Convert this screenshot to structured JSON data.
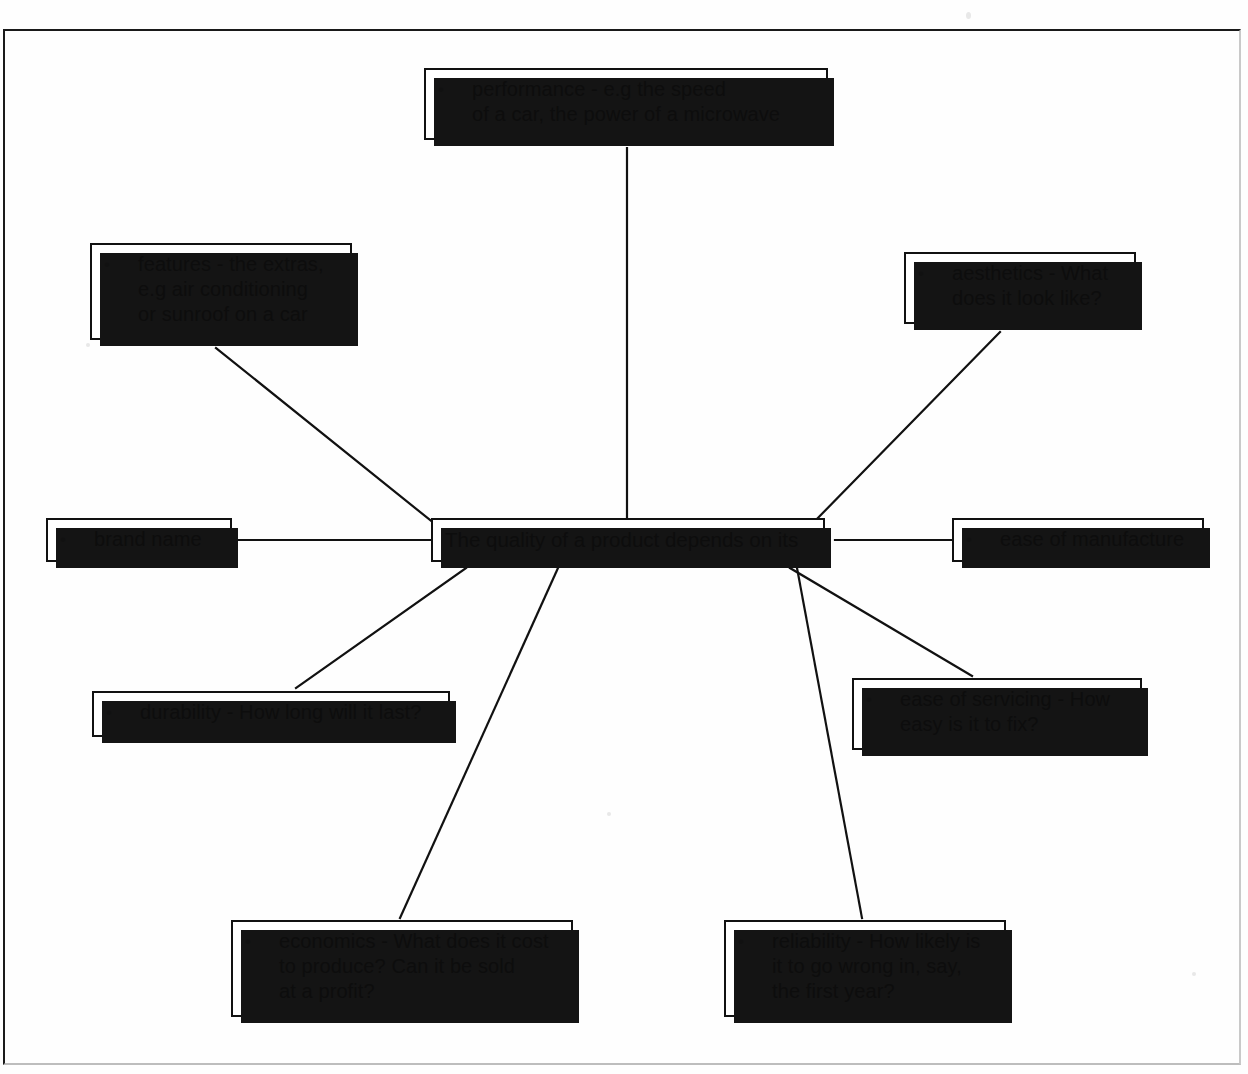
{
  "diagram": {
    "type": "mind-map",
    "title_node": "The quality of a product depends on its",
    "bullet_glyph": "•",
    "colors": {
      "ink": "#111111",
      "paper": "#ffffff",
      "shadow": "#141414",
      "frame": "#1a1a1a"
    },
    "center": {
      "label": "The quality of a product depends on its",
      "x": 431,
      "y": 518,
      "w": 394,
      "h": 44
    },
    "nodes": [
      {
        "id": "performance",
        "label": "performance - e.g the speed\nof a car, the power of a microwave",
        "bullet": "•",
        "x": 424,
        "y": 68,
        "w": 404,
        "h": 72
      },
      {
        "id": "features",
        "label": "features - the extras,\ne.g air conditioning\nor sunroof on a car",
        "bullet": "•",
        "x": 90,
        "y": 243,
        "w": 262,
        "h": 97
      },
      {
        "id": "aesthetics",
        "label": "aesthetics - What\ndoes it look like?",
        "bullet": "•",
        "x": 904,
        "y": 252,
        "w": 232,
        "h": 72
      },
      {
        "id": "brand-name",
        "label": "brand name",
        "bullet": "•",
        "x": 46,
        "y": 518,
        "w": 186,
        "h": 44
      },
      {
        "id": "ease-of-manufacture",
        "label": "ease of manufacture",
        "bullet": "•",
        "x": 952,
        "y": 518,
        "w": 252,
        "h": 44
      },
      {
        "id": "durability",
        "label": "durability - How long will it last?",
        "bullet": "•",
        "x": 92,
        "y": 691,
        "w": 358,
        "h": 46
      },
      {
        "id": "ease-of-servicing",
        "label": "ease of servicing - How\neasy is it to fix?",
        "bullet": "•",
        "x": 852,
        "y": 678,
        "w": 290,
        "h": 72
      },
      {
        "id": "economics",
        "label": "economics - What does it cost\nto produce? Can it be sold\nat a profit?",
        "bullet": "•",
        "x": 231,
        "y": 920,
        "w": 342,
        "h": 97
      },
      {
        "id": "reliability",
        "label": "reliability - How likely is\nit to go wrong in, say,\nthe first year?",
        "bullet": "•",
        "x": 724,
        "y": 920,
        "w": 282,
        "h": 97
      }
    ],
    "connectors": [
      {
        "from": "center",
        "to": "performance",
        "x1": 627,
        "y1": 518,
        "x2": 627,
        "y2": 148
      },
      {
        "from": "center",
        "to": "features",
        "x1": 440,
        "y1": 528,
        "x2": 216,
        "y2": 348
      },
      {
        "from": "center",
        "to": "aesthetics",
        "x1": 812,
        "y1": 524,
        "x2": 1000,
        "y2": 332
      },
      {
        "from": "center",
        "to": "brand-name",
        "x1": 431,
        "y1": 540,
        "x2": 232,
        "y2": 540
      },
      {
        "from": "center",
        "to": "ease-of-manufacture",
        "x1": 835,
        "y1": 540,
        "x2": 960,
        "y2": 540
      },
      {
        "from": "center",
        "to": "durability",
        "x1": 466,
        "y1": 568,
        "x2": 296,
        "y2": 688
      },
      {
        "from": "center",
        "to": "ease-of-servicing",
        "x1": 790,
        "y1": 568,
        "x2": 972,
        "y2": 676
      },
      {
        "from": "center",
        "to": "economics",
        "x1": 558,
        "y1": 568,
        "x2": 400,
        "y2": 918
      },
      {
        "from": "center",
        "to": "reliability",
        "x1": 797,
        "y1": 568,
        "x2": 862,
        "y2": 918
      }
    ]
  }
}
